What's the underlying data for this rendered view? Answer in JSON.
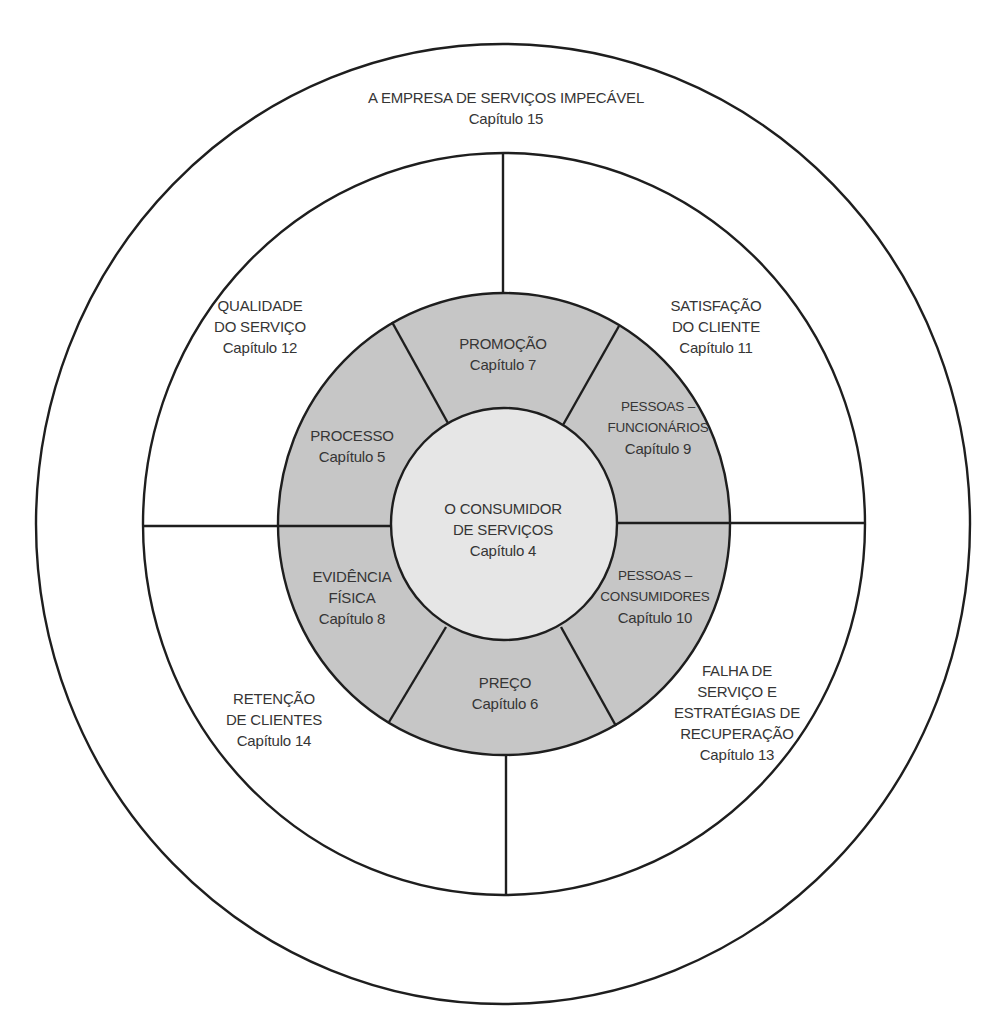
{
  "diagram": {
    "type": "concentric-circle",
    "colors": {
      "line": "#1e1e1e",
      "ring_fill": "#c6c6c6",
      "core_fill": "#e6e6e6",
      "text": "#353535",
      "background": "#ffffff"
    },
    "outer_ring": {
      "title": "A EMPRESA DE SERVIÇOS IMPECÁVEL",
      "chapter": "Capítulo 15"
    },
    "quadrants": [
      {
        "id": "quality",
        "lines": [
          "QUALIDADE",
          "DO SERVIÇO"
        ],
        "chapter": "Capítulo 12"
      },
      {
        "id": "satisfaction",
        "lines": [
          "SATISFAÇÃO",
          "DO CLIENTE"
        ],
        "chapter": "Capítulo 11"
      },
      {
        "id": "retention",
        "lines": [
          "RETENÇÃO",
          "DE CLIENTES"
        ],
        "chapter": "Capítulo 14"
      },
      {
        "id": "recovery",
        "lines": [
          "FALHA DE",
          "SERVIÇO E",
          "ESTRATÉGIAS DE",
          "RECUPERAÇÃO"
        ],
        "chapter": "Capítulo 13"
      }
    ],
    "mix_segments": [
      {
        "id": "promotion",
        "lines": [
          "PROMOÇÃO"
        ],
        "chapter": "Capítulo 7"
      },
      {
        "id": "people-employees",
        "lines": [
          "PESSOAS –",
          "FUNCIONÁRIOS"
        ],
        "chapter": "Capítulo 9"
      },
      {
        "id": "people-consumers",
        "lines": [
          "PESSOAS –",
          "CONSUMIDORES"
        ],
        "chapter": "Capítulo 10"
      },
      {
        "id": "price",
        "lines": [
          "PREÇO"
        ],
        "chapter": "Capítulo 6"
      },
      {
        "id": "physical-evidence",
        "lines": [
          "EVIDÊNCIA",
          "FÍSICA"
        ],
        "chapter": "Capítulo 8"
      },
      {
        "id": "process",
        "lines": [
          "PROCESSO"
        ],
        "chapter": "Capítulo 5"
      }
    ],
    "core": {
      "lines": [
        "O CONSUMIDOR",
        "DE SERVIÇOS"
      ],
      "chapter": "Capítulo 4"
    }
  }
}
